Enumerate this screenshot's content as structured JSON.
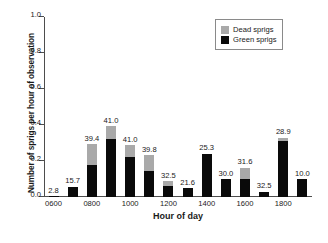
{
  "chart_data": {
    "type": "bar",
    "title": "",
    "xlabel": "Hour of day",
    "ylabel": "Number of sprigs per hour of observation",
    "ylim": [
      0.0,
      1.0
    ],
    "yticks": [
      "0.0",
      "0.2",
      "0.4",
      "0.6",
      "0.8",
      "1.0"
    ],
    "ytick_values": [
      0.0,
      0.2,
      0.4,
      0.6,
      0.8,
      1.0
    ],
    "grid": false,
    "stacked": true,
    "legend_position": "top-right",
    "legend": [
      {
        "name": "Dead sprigs",
        "color": "#a9a9a9"
      },
      {
        "name": "Green sprigs",
        "color": "#0a0a0a"
      }
    ],
    "categories": [
      "0600",
      "0700",
      "0800",
      "0900",
      "1000",
      "1100",
      "1200",
      "1300",
      "1400",
      "1500",
      "1600",
      "1700",
      "1800",
      "1900"
    ],
    "xtick_labels": [
      "0600",
      "0800",
      "1000",
      "1200",
      "1400",
      "1600",
      "1800"
    ],
    "xtick_categories": [
      "0600",
      "0800",
      "1000",
      "1200",
      "1400",
      "1600",
      "1800"
    ],
    "series": [
      {
        "name": "Green sprigs",
        "color": "#0a0a0a",
        "values": [
          0.004,
          0.057,
          0.18,
          0.32,
          0.22,
          0.147,
          0.06,
          0.05,
          0.24,
          0.1,
          0.1,
          0.03,
          0.31,
          0.1
        ]
      },
      {
        "name": "Dead sprigs",
        "color": "#a9a9a9",
        "values": [
          0.0,
          0.0,
          0.113,
          0.072,
          0.068,
          0.085,
          0.027,
          0.0,
          0.0,
          0.0,
          0.062,
          0.0,
          0.018,
          0.0
        ]
      }
    ],
    "totals": [
      0.004,
      0.057,
      0.293,
      0.392,
      0.288,
      0.232,
      0.087,
      0.05,
      0.24,
      0.1,
      0.162,
      0.03,
      0.328,
      0.1
    ],
    "bar_labels": [
      "2.8",
      "15.7",
      "39.4",
      "41.0",
      "41.0",
      "39.8",
      "32.5",
      "21.6",
      "25.3",
      "30.0",
      "31.6",
      "32.5",
      "28.9",
      "10.0"
    ]
  }
}
